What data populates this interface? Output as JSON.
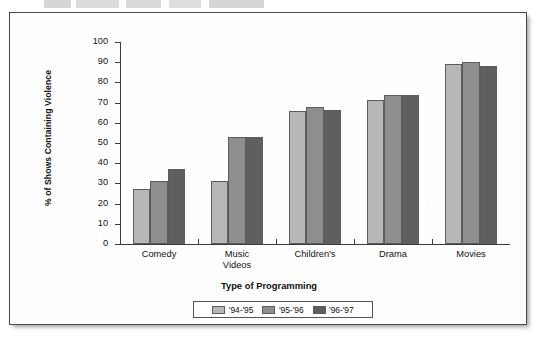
{
  "chart_data": {
    "type": "bar",
    "title": "",
    "xlabel": "Type of Programming",
    "ylabel": "% of Shows Containing Violence",
    "categories": [
      "Comedy",
      "Music\nVideos",
      "Children's",
      "Drama",
      "Movies"
    ],
    "series": [
      {
        "name": "'94-'95",
        "color": "#b7b7b7",
        "values": [
          27,
          31,
          66,
          71.5,
          89
        ]
      },
      {
        "name": "'95-'96",
        "color": "#8e8e8e",
        "values": [
          31,
          53,
          68,
          74,
          90
        ]
      },
      {
        "name": "'96-'97",
        "color": "#5f5f5f",
        "values": [
          37,
          53,
          66.5,
          74,
          88
        ]
      }
    ],
    "ylim": [
      0,
      100
    ],
    "ytick_labels": [
      "100",
      "90",
      "80",
      "70",
      "60",
      "50",
      "40",
      "30",
      "20",
      "10",
      "0"
    ],
    "ytick_values": [
      100,
      90,
      80,
      70,
      60,
      50,
      40,
      30,
      20,
      10,
      0
    ],
    "grid": false,
    "legend_position": "bottom-center"
  },
  "figure": {
    "frame_border_color": "#4a4a4a",
    "background": "#fefefe"
  }
}
